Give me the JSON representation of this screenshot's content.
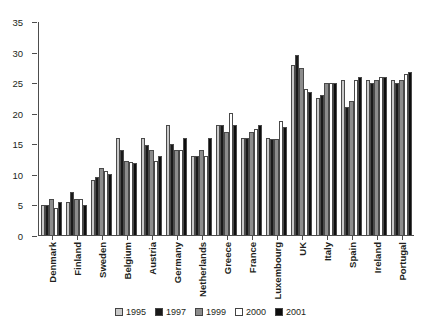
{
  "chart_data": {
    "type": "bar",
    "title": "",
    "xlabel": "",
    "ylabel": "",
    "ylim": [
      0,
      35
    ],
    "yticks": [
      0,
      5,
      10,
      15,
      20,
      25,
      30,
      35
    ],
    "grid": false,
    "legend_position": "bottom",
    "categories": [
      "Denmark",
      "Finland",
      "Sweden",
      "Belgium",
      "Austria",
      "Germany",
      "Netherlands",
      "Greece",
      "France",
      "Luxembourg",
      "UK",
      "Italy",
      "Spain",
      "Ireland",
      "Portugal"
    ],
    "series": [
      {
        "name": "1995",
        "color": "#c9c9c9",
        "values": [
          5.0,
          5.5,
          9.0,
          16.0,
          16.0,
          18.0,
          13.0,
          18.0,
          16.0,
          16.0,
          28.0,
          22.5,
          25.5,
          25.5,
          25.5
        ]
      },
      {
        "name": "1997",
        "color": "#1a1a1a",
        "values": [
          5.0,
          7.0,
          9.5,
          14.0,
          14.8,
          15.0,
          13.0,
          18.0,
          16.0,
          15.8,
          29.5,
          23.0,
          21.0,
          25.0,
          25.0
        ]
      },
      {
        "name": "1999",
        "color": "#8c8c8c",
        "values": [
          6.0,
          6.0,
          11.0,
          12.2,
          14.0,
          14.0,
          14.0,
          17.0,
          17.0,
          15.8,
          27.5,
          25.0,
          22.0,
          25.5,
          25.5
        ]
      },
      {
        "name": "2000",
        "color": "#ffffff",
        "values": [
          4.5,
          6.0,
          10.5,
          12.0,
          12.2,
          14.0,
          13.0,
          20.0,
          17.5,
          18.8,
          24.0,
          25.0,
          25.5,
          26.0,
          26.5
        ]
      },
      {
        "name": "2001",
        "color": "#0d0d0d",
        "values": [
          5.5,
          5.0,
          10.0,
          11.8,
          13.0,
          16.0,
          16.0,
          18.0,
          18.0,
          17.8,
          23.5,
          25.0,
          26.0,
          26.0,
          26.8
        ]
      }
    ]
  },
  "legend": {
    "items": [
      {
        "label": "1995"
      },
      {
        "label": "1997"
      },
      {
        "label": "1999"
      },
      {
        "label": "2000"
      },
      {
        "label": "2001"
      }
    ]
  }
}
